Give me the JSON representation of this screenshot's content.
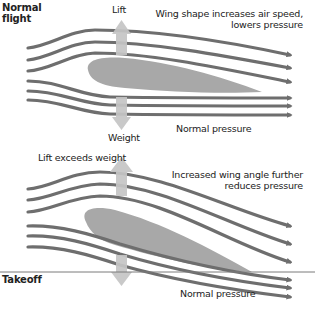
{
  "panels": [
    {
      "title_line1": "Normal",
      "title_line2": "flight",
      "lift_label": "Lift",
      "weight_label": "Weight",
      "note_line1": "Wing shape increases air speed,",
      "note_line2": "lowers pressure",
      "bottom_label": "Normal pressure"
    },
    {
      "title": "Takeoff",
      "lift_label": "Lift exceeds weight",
      "note_line1": "Increased wing angle further",
      "note_line2": "reduces pressure",
      "bottom_label": "Normal pressure"
    }
  ],
  "colors": {
    "airflow": "#6e6e6e",
    "wing": "#a8a8a8",
    "force_arrow": "#c4c4c4",
    "divider": "#7a7a7a",
    "text": "#222222"
  }
}
